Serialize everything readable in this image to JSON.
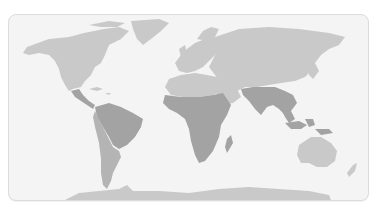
{
  "map": {
    "title": "World map with highlighted tropical regions",
    "projection": "equirectangular-like world map",
    "colors": {
      "sea": "#f4f4f4",
      "land": "#c9c9c9",
      "highlight": "#a3a3a3",
      "highlight_secondary": "#b4b4b4",
      "frame_border": "#dcdcdc"
    },
    "highlighted_regions": [
      "Central America",
      "Northern South America (Amazon basin)",
      "Sub-Saharan Africa",
      "Madagascar",
      "South Asia (India)",
      "Southeast Asia",
      "Maritime Southeast Asia"
    ],
    "secondary_regions": [
      "Southern South America",
      "Western South America (Andes)"
    ],
    "unhighlighted_regions": [
      "North America",
      "Greenland",
      "Europe",
      "Northern Asia",
      "Middle East",
      "Australia",
      "New Zealand",
      "Antarctica"
    ]
  }
}
